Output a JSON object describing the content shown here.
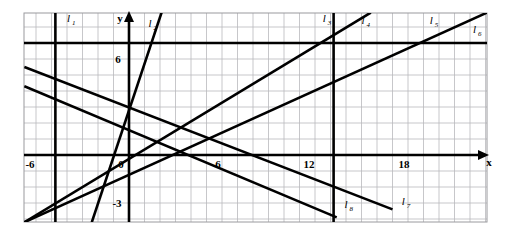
{
  "figure": {
    "background_color": "#ffffff",
    "ink_color": "#000000",
    "grid_color": "#b9b9bd",
    "frame_color": "#9a9a9e"
  },
  "chart_data": {
    "type": "line",
    "title": "",
    "xlabel": "x",
    "ylabel": "y",
    "xlim": [
      -6.75,
      23.1
    ],
    "ylim": [
      -4.2,
      8.9
    ],
    "grid": true,
    "grid_step_x": 1,
    "grid_step_y": 1,
    "legend": "inline-labels",
    "x_ticks": [
      -6,
      0,
      6,
      12,
      18
    ],
    "x_tick_labels": [
      "-6",
      "0",
      "6",
      "12",
      "18"
    ],
    "y_ticks": [
      6,
      0,
      -3
    ],
    "y_tick_labels": [
      "6",
      "0",
      "-3"
    ],
    "origin_label": "0",
    "series": [
      {
        "name": "l1",
        "label": "l",
        "subscript": "1",
        "kind": "vertical",
        "x": -4.75,
        "label_x": -4.0,
        "label_y": 8.3
      },
      {
        "name": "l2",
        "label": "l",
        "subscript": "2",
        "kind": "segment",
        "points": [
          [
            -2.4,
            -4.2
          ],
          [
            2.1,
            8.9
          ]
        ],
        "slope": 2.9,
        "label_x": 1.25,
        "label_y": 8.0
      },
      {
        "name": "l3",
        "label": "l",
        "subscript": "3",
        "kind": "vertical",
        "x": 13.2,
        "label_x": 12.5,
        "label_y": 8.3
      },
      {
        "name": "l4",
        "label": "l",
        "subscript": "4",
        "kind": "segment",
        "points": [
          [
            -6.75,
            -4.2
          ],
          [
            15.6,
            8.9
          ]
        ],
        "slope": 0.586,
        "label_x": 15.0,
        "label_y": 8.2
      },
      {
        "name": "l5",
        "label": "l",
        "subscript": "5",
        "kind": "segment",
        "points": [
          [
            -6.75,
            -4.2
          ],
          [
            23.1,
            8.9
          ]
        ],
        "slope": 0.44,
        "label_x": 19.4,
        "label_y": 8.2
      },
      {
        "name": "l6",
        "label": "l",
        "subscript": "6",
        "kind": "horizontal",
        "y": 7.0,
        "label_x": 22.2,
        "label_y": 7.6
      },
      {
        "name": "l7",
        "label": "l",
        "subscript": "7",
        "kind": "segment",
        "points": [
          [
            -6.75,
            5.5
          ],
          [
            17.0,
            -3.4
          ]
        ],
        "slope": -0.375,
        "label_x": 17.6,
        "label_y": -3.1
      },
      {
        "name": "l8",
        "label": "l",
        "subscript": "8",
        "kind": "segment",
        "points": [
          [
            -6.75,
            4.3
          ],
          [
            13.4,
            -3.9
          ]
        ],
        "slope": -0.41,
        "label_x": 13.9,
        "label_y": -3.3
      }
    ],
    "axes": [
      {
        "name": "x-axis",
        "label": "x",
        "arrow": "right"
      },
      {
        "name": "y-axis",
        "label": "y",
        "arrow": "up"
      }
    ]
  }
}
